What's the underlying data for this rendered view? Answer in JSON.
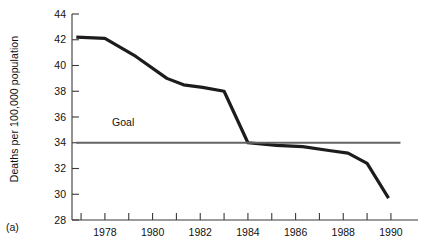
{
  "panel": {
    "label": "(a)"
  },
  "chart_data": {
    "type": "line",
    "title": "",
    "xlabel": "",
    "ylabel": "Deaths per 100,000 population",
    "xlim": [
      1976.2,
      1990.8
    ],
    "ylim": [
      28,
      44
    ],
    "grid": false,
    "legend": false,
    "y_ticks": [
      28,
      30,
      32,
      34,
      36,
      38,
      40,
      42,
      44
    ],
    "y_tick_labels": [
      "28",
      "30",
      "32",
      "34",
      "36",
      "38",
      "40",
      "42",
      "44"
    ],
    "x_ticks": [
      1977,
      1978,
      1979,
      1980,
      1981,
      1982,
      1983,
      1984,
      1985,
      1986,
      1987,
      1988,
      1989,
      1990
    ],
    "x_tick_labels": [
      "",
      "1978",
      "",
      "1980",
      "",
      "1982",
      "",
      "1984",
      "",
      "1986",
      "",
      "1988",
      "",
      "1990"
    ],
    "x_labeled_ticks": [
      1978,
      1980,
      1982,
      1984,
      1986,
      1988,
      1990
    ],
    "series": [
      {
        "name": "Death rate",
        "color": "#1c1c1c",
        "width": 3.2,
        "x": [
          1976.8,
          1978.0,
          1979.3,
          1980.6,
          1981.3,
          1982.1,
          1983.0,
          1984.0,
          1985.2,
          1986.3,
          1987.4,
          1988.2,
          1989.0,
          1989.9
        ],
        "values": [
          42.2,
          42.1,
          40.7,
          39.0,
          38.5,
          38.3,
          38.0,
          34.0,
          33.8,
          33.7,
          33.4,
          33.2,
          32.4,
          29.7
        ]
      },
      {
        "name": "Goal",
        "color": "#636363",
        "width": 2.2,
        "x": [
          1976.8,
          1990.4
        ],
        "values": [
          34.0,
          34.0
        ]
      }
    ],
    "annotations": [
      {
        "text": "Goal",
        "x": 1978.3,
        "y": 35.3
      }
    ]
  }
}
